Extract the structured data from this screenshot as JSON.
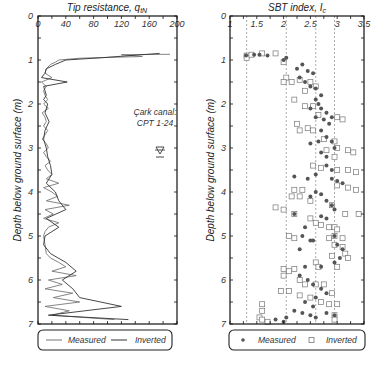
{
  "chart_data": [
    {
      "type": "line",
      "title": "Tip resistance, q_tN",
      "xlabel": "Tip resistance, q_tN",
      "ylabel": "Depth below ground surface (m)",
      "xlim": [
        0,
        200
      ],
      "ylim": [
        7,
        0
      ],
      "x_ticks": [
        "0",
        "40",
        "80",
        "120",
        "160",
        "200"
      ],
      "y_ticks": [
        "0",
        "1",
        "2",
        "3",
        "4",
        "5",
        "6",
        "7"
      ],
      "grid": false,
      "annotation": [
        "Çark canal:",
        "CPT 1-24"
      ],
      "water_table_symbol_depth": 2.55,
      "legend": [
        "Measured",
        "Inverted"
      ],
      "legend_position": "bottom",
      "series": [
        {
          "name": "Measured",
          "depth": [
            0.87,
            0.88,
            0.92,
            0.96,
            1.0,
            1.05,
            1.1,
            1.2,
            1.3,
            1.4,
            1.5,
            1.6,
            1.7,
            1.8,
            1.9,
            2.0,
            2.1,
            2.2,
            2.3,
            2.4,
            2.5,
            2.6,
            2.7,
            2.8,
            2.9,
            3.0,
            3.1,
            3.2,
            3.3,
            3.4,
            3.5,
            3.6,
            3.7,
            3.8,
            3.9,
            4.0,
            4.1,
            4.2,
            4.3,
            4.4,
            4.5,
            4.6,
            4.7,
            4.8,
            4.9,
            5.0,
            5.2,
            5.4,
            5.5,
            5.6,
            5.7,
            5.8,
            5.9,
            6.0,
            6.1,
            6.2,
            6.3,
            6.4,
            6.5,
            6.6,
            6.7,
            6.8,
            6.9
          ],
          "values": [
            190,
            120,
            150,
            60,
            30,
            25,
            18,
            12,
            10,
            20,
            5,
            12,
            8,
            10,
            14,
            8,
            15,
            6,
            10,
            12,
            8,
            14,
            10,
            6,
            12,
            15,
            8,
            12,
            18,
            10,
            14,
            20,
            12,
            30,
            8,
            20,
            28,
            12,
            45,
            10,
            22,
            8,
            30,
            15,
            10,
            8,
            10,
            12,
            18,
            30,
            40,
            20,
            55,
            15,
            35,
            10,
            50,
            22,
            60,
            10,
            45,
            20,
            110
          ]
        },
        {
          "name": "Inverted",
          "depth": [
            0.85,
            0.95,
            1.0,
            1.1,
            1.2,
            1.3,
            1.4,
            1.5,
            1.6,
            1.7,
            1.8,
            1.9,
            2.0,
            2.2,
            2.4,
            2.6,
            2.8,
            3.0,
            3.2,
            3.4,
            3.6,
            3.8,
            4.0,
            4.2,
            4.4,
            4.6,
            4.8,
            5.0,
            5.2,
            5.4,
            5.6,
            5.8,
            6.0,
            6.2,
            6.4,
            6.6,
            6.8,
            6.9
          ],
          "values": [
            175,
            90,
            40,
            25,
            12,
            10,
            5,
            42,
            8,
            10,
            12,
            8,
            14,
            10,
            16,
            10,
            8,
            12,
            14,
            18,
            20,
            12,
            25,
            30,
            40,
            12,
            30,
            10,
            8,
            18,
            40,
            55,
            35,
            50,
            60,
            120,
            15,
            130
          ]
        }
      ]
    },
    {
      "type": "scatter",
      "title": "SBT index, I_c",
      "xlabel": "SBT index, I_c",
      "ylabel": "Depth below ground surface (m)",
      "xlim": [
        1,
        3.5
      ],
      "ylim": [
        7,
        0
      ],
      "x_ticks": [
        "1",
        "1.5",
        "2",
        "2.5",
        "3",
        "3.5"
      ],
      "y_ticks": [
        "0",
        "1",
        "2",
        "3",
        "4",
        "5",
        "6",
        "7"
      ],
      "reference_lines_x": [
        1.31,
        2.05,
        2.6,
        2.95
      ],
      "reference_line_style": "dashed",
      "grid": false,
      "legend": [
        "Measured",
        "Inverted"
      ],
      "legend_position": "bottom",
      "series": [
        {
          "name": "Measured",
          "marker": "filled-circle",
          "points": [
            [
              1.3,
              0.9
            ],
            [
              1.45,
              0.88
            ],
            [
              1.55,
              0.88
            ],
            [
              1.7,
              0.9
            ],
            [
              2.0,
              1.0
            ],
            [
              2.05,
              0.95
            ],
            [
              2.25,
              1.2
            ],
            [
              2.35,
              1.1
            ],
            [
              2.45,
              1.25
            ],
            [
              2.3,
              1.4
            ],
            [
              2.55,
              1.3
            ],
            [
              2.4,
              1.5
            ],
            [
              2.5,
              1.6
            ],
            [
              2.6,
              1.65
            ],
            [
              2.7,
              1.8
            ],
            [
              2.6,
              1.9
            ],
            [
              2.65,
              2.0
            ],
            [
              2.5,
              2.1
            ],
            [
              2.7,
              2.1
            ],
            [
              2.8,
              2.2
            ],
            [
              2.6,
              2.3
            ],
            [
              2.75,
              2.35
            ],
            [
              2.9,
              2.3
            ],
            [
              2.85,
              2.45
            ],
            [
              2.7,
              2.6
            ],
            [
              2.8,
              2.75
            ],
            [
              2.65,
              2.85
            ],
            [
              2.5,
              2.9
            ],
            [
              2.9,
              2.85
            ],
            [
              2.7,
              3.1
            ],
            [
              2.8,
              3.2
            ],
            [
              2.95,
              3.0
            ],
            [
              2.8,
              3.4
            ],
            [
              2.9,
              3.5
            ],
            [
              2.6,
              3.6
            ],
            [
              2.2,
              3.65
            ],
            [
              2.45,
              3.7
            ],
            [
              2.9,
              3.7
            ],
            [
              3.0,
              3.75
            ],
            [
              3.1,
              3.8
            ],
            [
              2.6,
              4.0
            ],
            [
              2.7,
              4.05
            ],
            [
              2.5,
              4.1
            ],
            [
              2.8,
              4.2
            ],
            [
              2.9,
              4.3
            ],
            [
              2.95,
              4.4
            ],
            [
              2.2,
              4.5
            ],
            [
              2.7,
              4.55
            ],
            [
              2.8,
              4.6
            ],
            [
              2.4,
              4.8
            ],
            [
              2.35,
              5.0
            ],
            [
              2.55,
              5.1
            ],
            [
              2.3,
              5.3
            ],
            [
              2.5,
              5.1
            ],
            [
              2.95,
              5.0
            ],
            [
              3.0,
              5.2
            ],
            [
              3.1,
              5.3
            ],
            [
              3.05,
              5.5
            ],
            [
              2.95,
              5.6
            ],
            [
              2.4,
              5.7
            ],
            [
              2.7,
              5.7
            ],
            [
              2.3,
              5.9
            ],
            [
              2.45,
              6.0
            ],
            [
              2.55,
              6.1
            ],
            [
              2.7,
              6.2
            ],
            [
              2.8,
              6.3
            ],
            [
              2.6,
              6.4
            ],
            [
              2.4,
              6.5
            ],
            [
              2.55,
              6.6
            ],
            [
              2.2,
              6.7
            ],
            [
              2.35,
              6.75
            ],
            [
              2.5,
              6.8
            ],
            [
              2.6,
              6.85
            ],
            [
              2.8,
              6.75
            ],
            [
              2.95,
              6.8
            ],
            [
              1.85,
              6.9
            ],
            [
              2.0,
              6.95
            ],
            [
              2.05,
              6.85
            ]
          ]
        },
        {
          "name": "Inverted",
          "marker": "open-square",
          "points": [
            [
              1.31,
              0.9
            ],
            [
              1.31,
              0.95
            ],
            [
              1.4,
              0.88
            ],
            [
              1.6,
              0.85
            ],
            [
              1.85,
              0.85
            ],
            [
              2.0,
              1.05
            ],
            [
              2.05,
              1.4
            ],
            [
              2.0,
              1.5
            ],
            [
              2.15,
              1.5
            ],
            [
              2.3,
              1.45
            ],
            [
              2.5,
              1.5
            ],
            [
              2.6,
              1.6
            ],
            [
              2.4,
              1.7
            ],
            [
              2.2,
              1.9
            ],
            [
              2.4,
              2.05
            ],
            [
              2.55,
              2.05
            ],
            [
              2.65,
              2.25
            ],
            [
              3.0,
              2.3
            ],
            [
              3.1,
              2.35
            ],
            [
              2.25,
              2.45
            ],
            [
              2.3,
              2.6
            ],
            [
              2.45,
              2.55
            ],
            [
              2.55,
              2.6
            ],
            [
              2.75,
              2.8
            ],
            [
              2.95,
              2.85
            ],
            [
              2.8,
              3.05
            ],
            [
              3.0,
              3.0
            ],
            [
              3.2,
              3.05
            ],
            [
              3.3,
              3.1
            ],
            [
              2.95,
              3.2
            ],
            [
              2.55,
              3.4
            ],
            [
              2.7,
              3.45
            ],
            [
              3.0,
              3.5
            ],
            [
              3.2,
              3.5
            ],
            [
              3.35,
              3.55
            ],
            [
              3.0,
              3.85
            ],
            [
              3.2,
              3.9
            ],
            [
              3.35,
              3.95
            ],
            [
              2.2,
              3.95
            ],
            [
              2.35,
              3.95
            ],
            [
              2.15,
              4.1
            ],
            [
              2.3,
              4.1
            ],
            [
              2.5,
              4.2
            ],
            [
              2.9,
              4.3
            ],
            [
              3.15,
              4.5
            ],
            [
              3.4,
              4.5
            ],
            [
              2.0,
              4.4
            ],
            [
              1.85,
              4.35
            ],
            [
              2.2,
              4.5
            ],
            [
              2.5,
              4.6
            ],
            [
              2.6,
              4.7
            ],
            [
              2.7,
              4.75
            ],
            [
              2.85,
              4.8
            ],
            [
              2.95,
              4.8
            ],
            [
              3.0,
              4.85
            ],
            [
              2.1,
              5.0
            ],
            [
              2.2,
              5.05
            ],
            [
              2.85,
              5.05
            ],
            [
              2.95,
              5.0
            ],
            [
              3.1,
              5.05
            ],
            [
              2.95,
              5.2
            ],
            [
              3.1,
              5.25
            ],
            [
              3.15,
              5.4
            ],
            [
              2.9,
              5.45
            ],
            [
              3.2,
              5.5
            ],
            [
              3.0,
              5.7
            ],
            [
              2.6,
              5.6
            ],
            [
              2.65,
              5.7
            ],
            [
              2.0,
              5.75
            ],
            [
              2.1,
              5.8
            ],
            [
              2.2,
              5.75
            ],
            [
              2.0,
              5.9
            ],
            [
              2.3,
              6.0
            ],
            [
              2.4,
              6.1
            ],
            [
              2.6,
              6.1
            ],
            [
              2.75,
              6.1
            ],
            [
              1.95,
              6.25
            ],
            [
              2.1,
              6.25
            ],
            [
              2.3,
              6.35
            ],
            [
              2.5,
              6.4
            ],
            [
              2.7,
              6.5
            ],
            [
              2.85,
              6.55
            ],
            [
              3.0,
              6.55
            ],
            [
              2.9,
              6.3
            ],
            [
              1.6,
              6.55
            ],
            [
              1.6,
              6.7
            ],
            [
              2.95,
              6.8
            ],
            [
              2.95,
              6.9
            ],
            [
              1.55,
              6.85
            ],
            [
              1.6,
              6.9
            ],
            [
              1.7,
              6.95
            ]
          ]
        }
      ]
    }
  ],
  "left_panel": {
    "title_text": "Tip resistance, ",
    "title_var": "q",
    "title_sub": "tN",
    "x_ticks": [
      "0",
      "40",
      "80",
      "120",
      "160",
      "200"
    ],
    "y_ticks": [
      "0",
      "1",
      "2",
      "3",
      "4",
      "5",
      "6",
      "7"
    ],
    "ylabel": "Depth below ground surface (m)",
    "annotation_line1": "Çark canal:",
    "annotation_line2": "CPT 1-24",
    "water_table_symbol": "∇",
    "legend_measured": "Measured",
    "legend_inverted": "Inverted"
  },
  "right_panel": {
    "title_text": "SBT index, ",
    "title_var": "I",
    "title_sub": "c",
    "x_ticks": [
      "1",
      "1.5",
      "2",
      "2.5",
      "3",
      "3.5"
    ],
    "y_ticks": [
      "0",
      "1",
      "2",
      "3",
      "4",
      "5",
      "6",
      "7"
    ],
    "ylabel": "Depth below ground surface (m)",
    "legend_measured": "Measured",
    "legend_inverted": "Inverted"
  },
  "colors": {
    "measured_line": "#777777",
    "inverted_line": "#333333",
    "measured_marker": "#555555",
    "inverted_marker": "#777777",
    "axis": "#111111",
    "dashed_ref": "#888888"
  }
}
